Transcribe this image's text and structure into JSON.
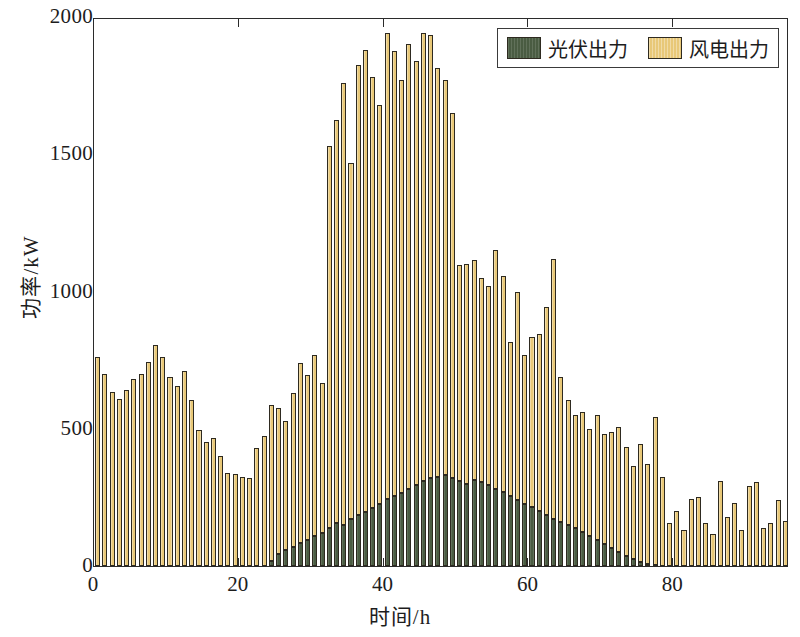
{
  "chart_data": {
    "type": "bar",
    "stacked": true,
    "title": "",
    "xlabel": "时间/h",
    "ylabel": "功率/kW",
    "xlim": [
      0,
      96
    ],
    "ylim": [
      0,
      2000
    ],
    "xticks": [
      0,
      20,
      40,
      60,
      80
    ],
    "yticks": [
      0,
      500,
      1000,
      1500,
      2000
    ],
    "xtick_labels": [
      "0",
      "20",
      "40",
      "60",
      "80"
    ],
    "ytick_labels": [
      "0",
      "500",
      "1000",
      "1500",
      "2000"
    ],
    "grid": false,
    "legend_position": "top-right",
    "colors": {
      "pv": "#4a5c42",
      "wind": "#e8c878",
      "axis": "#2b2b2b",
      "background": "#ffffff",
      "bar_edge": "#2e2a20"
    },
    "x": [
      0,
      1,
      2,
      3,
      4,
      5,
      6,
      7,
      8,
      9,
      10,
      11,
      12,
      13,
      14,
      15,
      16,
      17,
      18,
      19,
      20,
      21,
      22,
      23,
      24,
      25,
      26,
      27,
      28,
      29,
      30,
      31,
      32,
      33,
      34,
      35,
      36,
      37,
      38,
      39,
      40,
      41,
      42,
      43,
      44,
      45,
      46,
      47,
      48,
      49,
      50,
      51,
      52,
      53,
      54,
      55,
      56,
      57,
      58,
      59,
      60,
      61,
      62,
      63,
      64,
      65,
      66,
      67,
      68,
      69,
      70,
      71,
      72,
      73,
      74,
      75,
      76,
      77,
      78,
      79,
      80,
      81,
      82,
      83,
      84,
      85,
      86,
      87,
      88,
      89,
      90,
      91,
      92,
      93,
      94,
      95
    ],
    "series": [
      {
        "name": "光伏出力",
        "key": "pv",
        "values": [
          0,
          0,
          0,
          0,
          0,
          0,
          0,
          0,
          0,
          0,
          0,
          0,
          0,
          0,
          0,
          0,
          0,
          0,
          0,
          0,
          0,
          0,
          0,
          0,
          20,
          45,
          60,
          70,
          85,
          95,
          110,
          120,
          140,
          155,
          150,
          170,
          185,
          195,
          210,
          225,
          245,
          255,
          265,
          280,
          295,
          310,
          320,
          325,
          330,
          320,
          310,
          300,
          315,
          305,
          295,
          280,
          270,
          255,
          240,
          225,
          215,
          200,
          185,
          170,
          160,
          150,
          140,
          125,
          110,
          95,
          80,
          65,
          50,
          35,
          25,
          15,
          8,
          4,
          0,
          0,
          0,
          0,
          0,
          0,
          0,
          0,
          0,
          0,
          0,
          0,
          0,
          0,
          0,
          0,
          0,
          0
        ]
      },
      {
        "name": "风电出力",
        "key": "wind",
        "values": [
          760,
          700,
          635,
          610,
          640,
          680,
          700,
          745,
          805,
          760,
          690,
          655,
          710,
          605,
          495,
          450,
          465,
          400,
          340,
          335,
          325,
          320,
          430,
          475,
          565,
          530,
          470,
          560,
          655,
          600,
          660,
          545,
          1390,
          1470,
          1610,
          1300,
          1640,
          1685,
          1570,
          1455,
          1695,
          1620,
          1505,
          1620,
          1545,
          1630,
          1615,
          1490,
          1440,
          1330,
          785,
          800,
          800,
          745,
          725,
          870,
          785,
          560,
          760,
          545,
          620,
          645,
          760,
          950,
          530,
          455,
          410,
          435,
          390,
          455,
          400,
          425,
          455,
          400,
          340,
          430,
          365,
          540,
          325,
          155,
          200,
          130,
          245,
          250,
          155,
          115,
          310,
          180,
          230,
          130,
          290,
          305,
          140,
          155,
          240,
          165
        ]
      }
    ],
    "total_values_note": "Bars are stacked: total = pv + wind"
  },
  "legend": {
    "entries": [
      {
        "label": "光伏出力",
        "key": "pv"
      },
      {
        "label": "风电出力",
        "key": "wind"
      }
    ]
  },
  "axes": {
    "x_title": "时间/h",
    "y_title": "功率/kW"
  }
}
